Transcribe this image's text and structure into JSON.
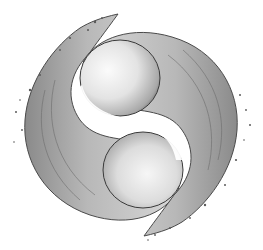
{
  "image": {
    "subject": "Liquid water yin-yang splash",
    "style": "grayscale",
    "colors": {
      "background": "#ffffff",
      "liquid_light": "#f2f2f2",
      "liquid_mid": "#bdbdbd",
      "liquid_dark": "#6e6e6e",
      "edge": "#3a3a3a"
    }
  }
}
